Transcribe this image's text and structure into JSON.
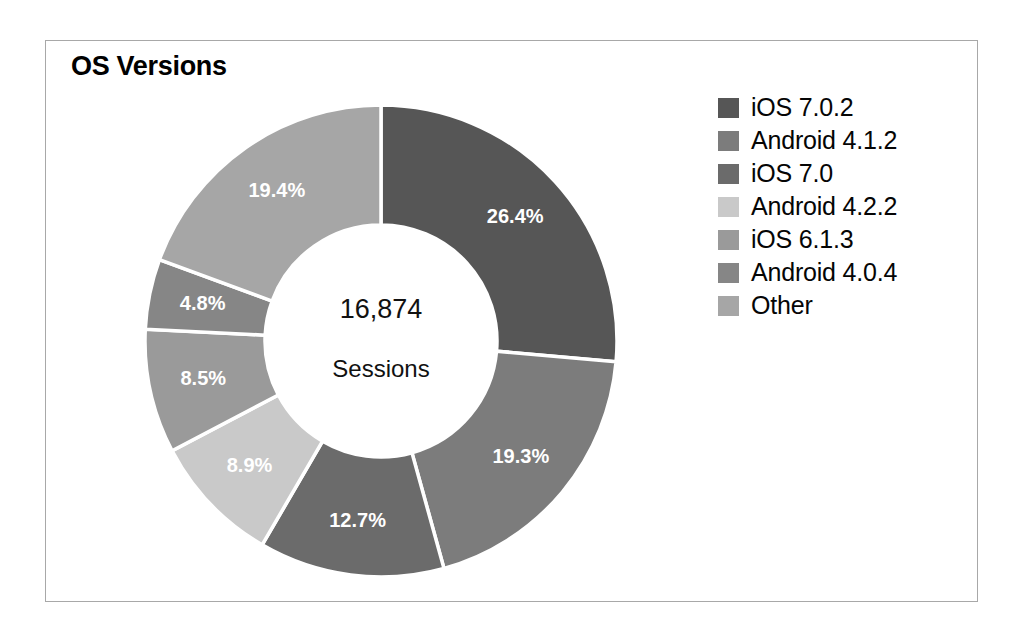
{
  "chart_data": {
    "type": "pie",
    "variant": "donut",
    "title": "OS Versions",
    "center_value": "16,874",
    "center_label": "Sessions",
    "total_sessions": 16874,
    "units": "Sessions",
    "legend_position": "right",
    "grid": false,
    "start_angle_deg": 0,
    "direction": "clockwise",
    "categories": [
      "iOS 7.0.2",
      "Android 4.1.2",
      "iOS 7.0",
      "Android 4.2.2",
      "iOS 6.1.3",
      "Android 4.0.4",
      "Other"
    ],
    "values": [
      26.4,
      19.3,
      12.7,
      8.9,
      8.5,
      4.8,
      19.4
    ],
    "value_labels": [
      "26.4%",
      "19.3%",
      "12.7%",
      "8.9%",
      "8.5%",
      "4.8%",
      "19.4%"
    ],
    "colors": [
      "#565656",
      "#7c7c7c",
      "#6b6b6b",
      "#c9c9c9",
      "#9a9a9a",
      "#868686",
      "#a6a6a6"
    ],
    "slices": [
      {
        "label": "iOS 7.0.2",
        "value": 26.4,
        "display": "26.4%",
        "color": "#565656"
      },
      {
        "label": "Android 4.1.2",
        "value": 19.3,
        "display": "19.3%",
        "color": "#7c7c7c"
      },
      {
        "label": "iOS 7.0",
        "value": 12.7,
        "display": "12.7%",
        "color": "#6b6b6b"
      },
      {
        "label": "Android 4.2.2",
        "value": 8.9,
        "display": "8.9%",
        "color": "#c9c9c9"
      },
      {
        "label": "iOS 6.1.3",
        "value": 8.5,
        "display": "8.5%",
        "color": "#9a9a9a"
      },
      {
        "label": "Android 4.0.4",
        "value": 4.8,
        "display": "4.8%",
        "color": "#868686"
      },
      {
        "label": "Other",
        "value": 19.4,
        "display": "19.4%",
        "color": "#a6a6a6"
      }
    ]
  },
  "legend": {
    "items": [
      {
        "label": "iOS 7.0.2",
        "color": "#565656"
      },
      {
        "label": "Android 4.1.2",
        "color": "#7c7c7c"
      },
      {
        "label": "iOS 7.0",
        "color": "#6b6b6b"
      },
      {
        "label": "Android 4.2.2",
        "color": "#c9c9c9"
      },
      {
        "label": "iOS 6.1.3",
        "color": "#9a9a9a"
      },
      {
        "label": "Android 4.0.4",
        "color": "#868686"
      },
      {
        "label": "Other",
        "color": "#a6a6a6"
      }
    ]
  },
  "style": {
    "frame_border_color": "#a8a8a8",
    "background": "#ffffff",
    "slice_divider_color": "#ffffff",
    "label_text_color": "#ffffff",
    "center_text_color": "#111111"
  }
}
